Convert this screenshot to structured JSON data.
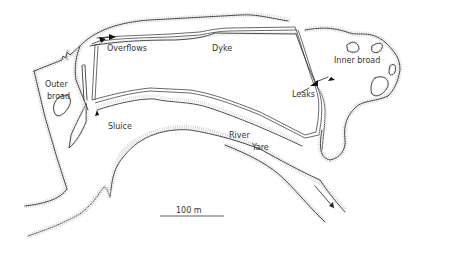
{
  "labels": {
    "overflows": "Overflows",
    "dyke": "Dyke",
    "inner_broad": "Inner broad",
    "outer_broad_line1": "Outer",
    "outer_broad_line2": "broad",
    "leaks": "Leaks",
    "sluice": "Sluice",
    "river_line1": "River",
    "river_line2": "Yare"
  },
  "scale_bar": {
    "label": "100 m",
    "length_px": 62
  },
  "flow_direction": "south-east (river flow arrow)",
  "colors": {
    "line": "#3a3a3a",
    "stipple": "#cfcfcf",
    "background": "#ffffff"
  }
}
